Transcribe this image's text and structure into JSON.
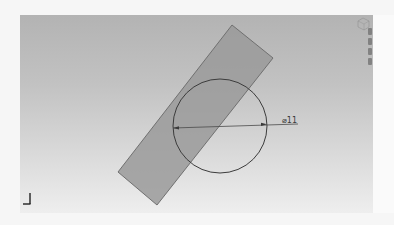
{
  "viewport": {
    "background_top": "#b3b3b3",
    "background_bottom": "#eeeeee"
  },
  "sketch": {
    "rectangle": {
      "fill": "#9a9a9a",
      "stroke": "#6e6e6e",
      "corners": [
        [
          232,
          25
        ],
        [
          273,
          58
        ],
        [
          157,
          205
        ],
        [
          118,
          172
        ]
      ]
    },
    "circle": {
      "center": [
        220,
        126
      ],
      "radius": 47,
      "stroke": "#3a3a3a"
    },
    "dimension": {
      "label": "⌀11",
      "line_start": [
        173,
        128
      ],
      "line_end": [
        298,
        124
      ]
    }
  },
  "overlays": {
    "viewcube_icon": "view-cube",
    "axis_triad_icon": "axis-triad"
  }
}
